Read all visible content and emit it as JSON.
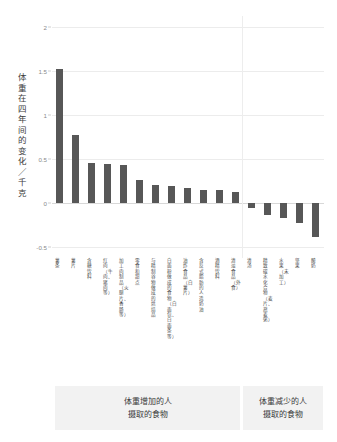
{
  "chart_data": {
    "type": "bar",
    "title": "",
    "xlabel": "",
    "ylabel": "体重在四年间的变化／千克",
    "ylim": [
      -0.6,
      2.1
    ],
    "yticks": [
      "2",
      "1.5",
      "1",
      "0.5",
      "0",
      "-0.5"
    ],
    "ytick_values": [
      2,
      1.5,
      1,
      0.5,
      0,
      -0.5
    ],
    "grid": true,
    "legend_position": "bottom",
    "categories": [
      "薯条",
      "薯片",
      "含糖饮料",
      "红肉（牛肉、猪肉等）",
      "加工肉制品（火腿片、香肠等）",
      "零食和甜点",
      "与精制谷物做成的烘焙品",
      "白面粉做成的食物（白面包、白面条等）",
      "油炸食品（白薯片）",
      "含反式脂肪的人造奶油",
      "酒精饮料",
      "清淡食品（外食）",
      "清汤",
      "精致碳水化合物（麦片、燕麦粥）",
      "水果（未加工）",
      "坚果",
      "酸奶"
    ],
    "values": [
      1.52,
      0.77,
      0.46,
      0.44,
      0.43,
      0.26,
      0.2,
      0.19,
      0.17,
      0.15,
      0.15,
      0.13,
      -0.06,
      -0.14,
      -0.17,
      -0.22,
      -0.38
    ],
    "bar_color": "#575757",
    "groups": [
      {
        "label_line1": "体重增加的人",
        "label_line2": "摄取的食物",
        "count": 12
      },
      {
        "label_line1": "体重减少的人",
        "label_line2": "摄取的食物",
        "count": 5
      }
    ]
  }
}
